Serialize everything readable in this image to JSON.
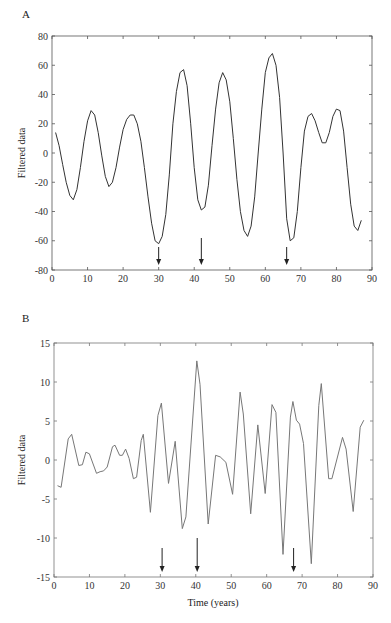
{
  "chart_data": [
    {
      "type": "line",
      "panel_label": "A",
      "title": "",
      "xlabel": "",
      "ylabel": "Filtered data",
      "xlim": [
        0,
        90
      ],
      "ylim": [
        -80,
        80
      ],
      "xticks": [
        0,
        10,
        20,
        30,
        40,
        50,
        60,
        70,
        80,
        90
      ],
      "yticks": [
        -80,
        -60,
        -40,
        -20,
        0,
        20,
        40,
        60,
        80
      ],
      "grid": false,
      "line_color": "#333333",
      "series": [
        {
          "name": "Filtered data A",
          "x": [
            1,
            2,
            3,
            4,
            5,
            6,
            7,
            8,
            9,
            10,
            11,
            12,
            13,
            14,
            15,
            16,
            17,
            18,
            19,
            20,
            21,
            22,
            23,
            24,
            25,
            26,
            27,
            28,
            29,
            30,
            31,
            32,
            33,
            34,
            35,
            36,
            37,
            38,
            39,
            40,
            41,
            42,
            43,
            44,
            45,
            46,
            47,
            48,
            49,
            50,
            51,
            52,
            53,
            54,
            55,
            56,
            57,
            58,
            59,
            60,
            61,
            62,
            63,
            64,
            65,
            66,
            67,
            68,
            69,
            70,
            71,
            72,
            73,
            74,
            75,
            76,
            77,
            78,
            79,
            80,
            81,
            82,
            83,
            84,
            85,
            86,
            87
          ],
          "y": [
            14,
            5,
            -8,
            -20,
            -29,
            -32,
            -25,
            -10,
            8,
            22,
            29,
            26,
            14,
            -2,
            -16,
            -23,
            -20,
            -10,
            4,
            16,
            23,
            26,
            26,
            20,
            8,
            -10,
            -30,
            -48,
            -60,
            -62,
            -57,
            -42,
            -15,
            20,
            42,
            55,
            57,
            46,
            20,
            -10,
            -32,
            -39,
            -37,
            -22,
            5,
            30,
            48,
            55,
            50,
            35,
            10,
            -18,
            -40,
            -53,
            -57,
            -50,
            -30,
            0,
            30,
            55,
            65,
            68,
            60,
            38,
            0,
            -45,
            -60,
            -58,
            -40,
            -10,
            15,
            25,
            27,
            22,
            14,
            7,
            7,
            14,
            25,
            30,
            29,
            15,
            -10,
            -35,
            -50,
            -53,
            -46,
            -35
          ],
          "note": "smooth oscillating curve"
        }
      ],
      "annotations": [
        {
          "type": "arrow-down",
          "x": 30
        },
        {
          "type": "arrow-down",
          "x": 42
        },
        {
          "type": "arrow-down",
          "x": 66
        }
      ]
    },
    {
      "type": "line",
      "panel_label": "B",
      "title": "",
      "xlabel": "Time (years)",
      "ylabel": "Filtered data",
      "xlim": [
        0,
        90
      ],
      "ylim": [
        -15,
        15
      ],
      "xticks": [
        0,
        10,
        20,
        30,
        40,
        50,
        60,
        70,
        80,
        90
      ],
      "yticks": [
        -15,
        -10,
        -5,
        0,
        5,
        10,
        15
      ],
      "grid": false,
      "line_color": "#777777",
      "series": [
        {
          "name": "Filtered data B",
          "x": [
            1,
            2,
            4,
            5,
            7,
            8,
            9,
            10,
            12,
            13,
            14,
            15,
            16.5,
            17.2,
            18.5,
            19.3,
            20.2,
            21.2,
            22.4,
            23.3,
            24.6,
            25.2,
            27.2,
            29.3,
            30.3,
            32.3,
            34.2,
            36.2,
            37.2,
            40.3,
            41.2,
            43.5,
            45.6,
            46.9,
            48.5,
            50.4,
            52.5,
            53.4,
            55.5,
            57.5,
            59.6,
            61.5,
            62.6,
            64.6,
            66.7,
            67.4,
            68.4,
            69.3,
            70.4,
            72.6,
            74.7,
            75.4,
            77.5,
            78.4,
            81.4,
            82.4,
            84.4,
            86.4,
            87.4
          ],
          "y": [
            -3.3,
            -3.5,
            2.7,
            3.3,
            -0.7,
            -0.6,
            1.0,
            0.8,
            -1.7,
            -1.5,
            -1.4,
            -0.9,
            1.7,
            1.9,
            0.6,
            0.6,
            1.4,
            0.2,
            -2.4,
            -2.2,
            2.5,
            3.3,
            -6.7,
            5.7,
            7.3,
            -3.0,
            2.4,
            -8.8,
            -7.3,
            12.7,
            9.7,
            -8.2,
            0.6,
            0.4,
            -0.3,
            -4.4,
            8.7,
            5.9,
            -6.9,
            4.5,
            -4.3,
            7.1,
            6.1,
            -12.1,
            5.5,
            7.5,
            5.1,
            4.6,
            2.1,
            -13.3,
            7.0,
            9.8,
            -2.4,
            -2.4,
            2.9,
            1.4,
            -6.6,
            4.2,
            5.1
          ]
        }
      ],
      "annotations": [
        {
          "type": "arrow-down",
          "x": 30.5
        },
        {
          "type": "arrow-down",
          "x": 40.4
        },
        {
          "type": "arrow-down",
          "x": 67.6
        }
      ]
    }
  ]
}
